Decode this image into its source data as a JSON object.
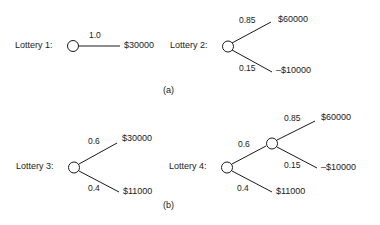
{
  "figure": {
    "background_color": "#ffffff",
    "stroke_color": "#1a1a1a",
    "text_color": "#1a1a1a",
    "node_fill": "#ffffff"
  },
  "panels": [
    {
      "id": "a",
      "label": "(a)"
    },
    {
      "id": "b",
      "label": "(b)"
    }
  ],
  "lotteries": [
    {
      "id": "lottery1",
      "name": "Lottery 1:",
      "branches": [
        {
          "probability": "1.0",
          "payoff": "$30000"
        }
      ]
    },
    {
      "id": "lottery2",
      "name": "Lottery 2:",
      "branches": [
        {
          "probability": "0.85",
          "payoff": "$60000"
        },
        {
          "probability": "0.15",
          "payoff": "–$10000"
        }
      ]
    },
    {
      "id": "lottery3",
      "name": "Lottery 3:",
      "branches": [
        {
          "probability": "0.6",
          "payoff": "$30000"
        },
        {
          "probability": "0.4",
          "payoff": "$11000"
        }
      ]
    },
    {
      "id": "lottery4",
      "name": "Lottery 4:",
      "branches": [
        {
          "probability": "0.6",
          "payoff": ""
        },
        {
          "probability": "0.4",
          "payoff": "$11000"
        }
      ],
      "subtree": {
        "branches": [
          {
            "probability": "0.85",
            "payoff": "$60000"
          },
          {
            "probability": "0.15",
            "payoff": "–$10000"
          }
        ]
      }
    }
  ]
}
